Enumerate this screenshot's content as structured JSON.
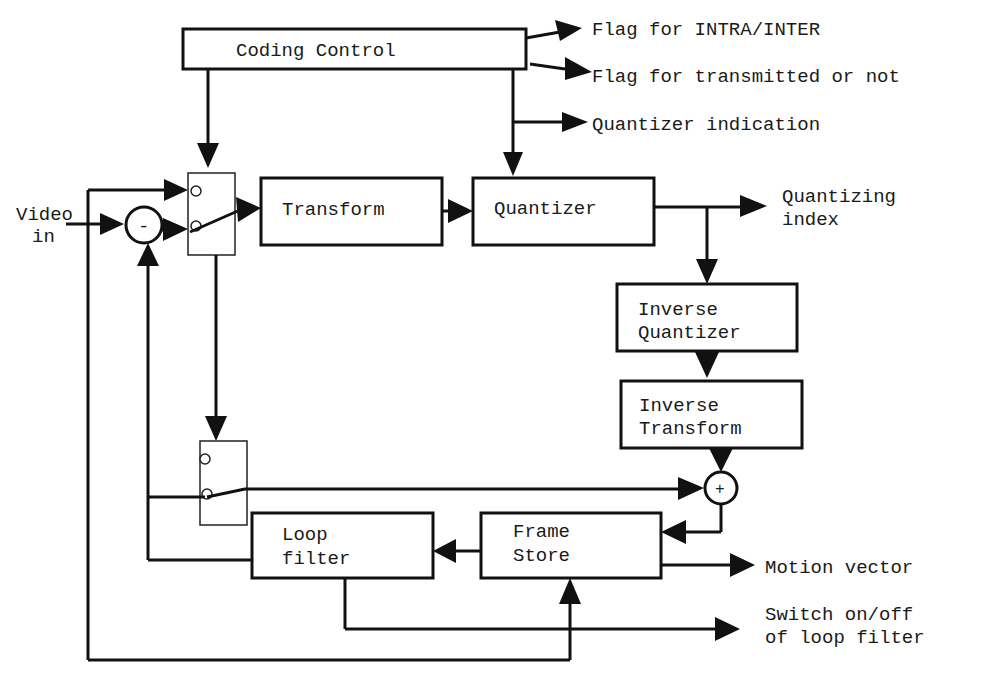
{
  "diagram": {
    "blocks": {
      "coding_control": "Coding Control",
      "transform": "Transform",
      "quantizer": "Quantizer",
      "inverse_quantizer_1": "Inverse",
      "inverse_quantizer_2": "Quantizer",
      "inverse_transform_1": "Inverse",
      "inverse_transform_2": "Transform",
      "loop_filter_1": "Loop",
      "loop_filter_2": "filter",
      "frame_store_1": "Frame",
      "frame_store_2": "Store"
    },
    "operators": {
      "subtract": "-",
      "add": "+"
    },
    "inputs": {
      "video_in_1": "Video",
      "video_in_2": "in"
    },
    "outputs": {
      "intra_inter": "Flag for INTRA/INTER",
      "transmitted": "Flag for transmitted or not",
      "quantizer_indication": "Quantizer indication",
      "quantizing_index_1": "Quantizing",
      "quantizing_index_2": "index",
      "motion_vector": "Motion vector",
      "switch_loop_1": "Switch on/off",
      "switch_loop_2": "of loop filter"
    }
  }
}
